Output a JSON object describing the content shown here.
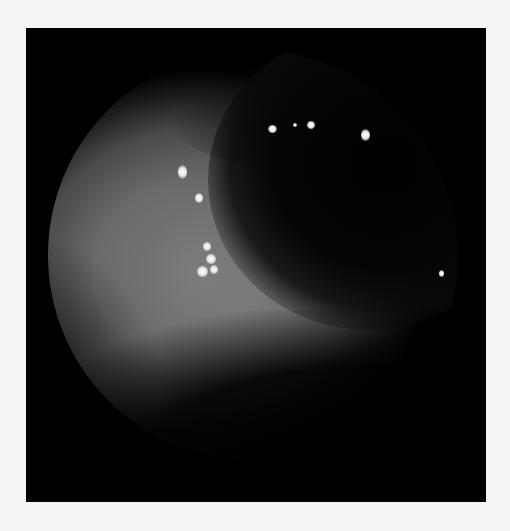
{
  "image": {
    "description": "Grayscale endoscopic view: circular field inside black frame on light background",
    "colors": {
      "background": "#f4f4f4",
      "frame": "#000000",
      "tissue": "#7a7a7a",
      "highlight": "#ffffff"
    },
    "highlights": [
      {
        "x": 182,
        "y": 172,
        "w": 9,
        "h": 14
      },
      {
        "x": 199,
        "y": 198,
        "w": 8,
        "h": 10
      },
      {
        "x": 207,
        "y": 246,
        "w": 8,
        "h": 9
      },
      {
        "x": 211,
        "y": 259,
        "w": 10,
        "h": 10
      },
      {
        "x": 202,
        "y": 271,
        "w": 11,
        "h": 11
      },
      {
        "x": 214,
        "y": 269,
        "w": 8,
        "h": 9
      },
      {
        "x": 272,
        "y": 129,
        "w": 9,
        "h": 8
      },
      {
        "x": 295,
        "y": 125,
        "w": 4,
        "h": 4
      },
      {
        "x": 311,
        "y": 125,
        "w": 8,
        "h": 8
      },
      {
        "x": 365,
        "y": 135,
        "w": 9,
        "h": 12
      },
      {
        "x": 441,
        "y": 273,
        "w": 5,
        "h": 7
      }
    ]
  }
}
